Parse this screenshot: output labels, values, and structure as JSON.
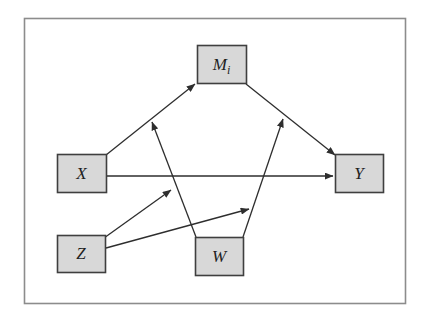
{
  "diagram": {
    "type": "path-diagram",
    "colors": {
      "background": "#ffffff",
      "frame_border": "#8c8c8c",
      "line": "#2e2e2e",
      "node_fill": "#d8d8d8",
      "node_border": "#3f3f3f",
      "label": "#1f1f1f"
    },
    "frame": {
      "x": 24,
      "y": 18,
      "w": 381,
      "h": 285
    },
    "nodes": [
      {
        "id": "Mi",
        "label": "M",
        "subscript": "i",
        "x": 197,
        "y": 45,
        "w": 49,
        "h": 38
      },
      {
        "id": "X",
        "label": "X",
        "subscript": "",
        "x": 57,
        "y": 154,
        "w": 49,
        "h": 38
      },
      {
        "id": "Y",
        "label": "Y",
        "subscript": "",
        "x": 335,
        "y": 154,
        "w": 48,
        "h": 38
      },
      {
        "id": "Z",
        "label": "Z",
        "subscript": "",
        "x": 57,
        "y": 235,
        "w": 48,
        "h": 37
      },
      {
        "id": "W",
        "label": "W",
        "subscript": "",
        "x": 195,
        "y": 237,
        "w": 48,
        "h": 38
      }
    ],
    "edges": [
      {
        "name": "x-to-mi",
        "x1": 106,
        "y1": 155,
        "x2": 195,
        "y2": 84
      },
      {
        "name": "mi-to-y",
        "x1": 246,
        "y1": 84,
        "x2": 335,
        "y2": 155
      },
      {
        "name": "x-to-y-direct",
        "x1": 106,
        "y1": 176,
        "x2": 333,
        "y2": 176
      },
      {
        "name": "w-to-x-mi-path",
        "x1": 196,
        "y1": 237,
        "x2": 152,
        "y2": 122
      },
      {
        "name": "w-to-mi-y-path",
        "x1": 243,
        "y1": 237,
        "x2": 283,
        "y2": 119
      },
      {
        "name": "z-to-w-left-arrow",
        "x1": 104,
        "y1": 238,
        "x2": 171,
        "y2": 190
      },
      {
        "name": "z-to-w-right-arrow",
        "x1": 106,
        "y1": 248,
        "x2": 249,
        "y2": 209
      }
    ]
  }
}
